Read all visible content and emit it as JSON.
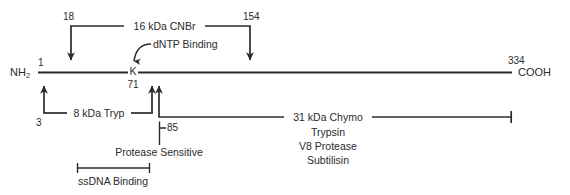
{
  "figure": {
    "kind": "protein-domain-map",
    "line_color": "#2b2b2b",
    "background_color": "#ffffff"
  },
  "backbone": {
    "n_terminus_label": "NH",
    "n_terminus_subscript": "2",
    "c_terminus_label": "COOH",
    "start_residue": "1",
    "end_residue": "334",
    "active_site_residue_letter": "K",
    "active_site_residue_number": "71"
  },
  "annotations": {
    "dntp_binding_label": "dNTP Binding",
    "protease_sensitive_label": "Protease Sensitive",
    "protease_sensitive_residue": "85"
  },
  "fragments": {
    "cnbr": {
      "label": "16 kDa CNBr",
      "start_residue": "18",
      "end_residue": "154",
      "position": "above"
    },
    "tryp": {
      "label": "8 kDa Tryp",
      "start_residue": "3",
      "end_residue": "71",
      "position": "below"
    },
    "chymo": {
      "label": "31 kDa Chymo",
      "start_residue": "85",
      "end_residue": "334",
      "position": "below",
      "additional_proteases": [
        "Trypsin",
        "V8 Protease",
        "Subtilisin"
      ]
    }
  },
  "domains": {
    "ssdna_binding": {
      "label": "ssDNA Binding"
    }
  }
}
